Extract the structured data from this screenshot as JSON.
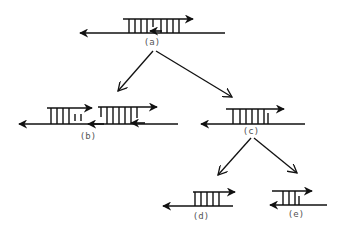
{
  "diagram": {
    "nodes": [
      {
        "id": "a",
        "label": "(a)"
      },
      {
        "id": "b",
        "label": "(b)"
      },
      {
        "id": "c",
        "label": "(c)"
      },
      {
        "id": "d",
        "label": "(d)"
      },
      {
        "id": "e",
        "label": "(e)"
      }
    ],
    "edges": [
      {
        "from": "a",
        "to": "b"
      },
      {
        "from": "a",
        "to": "c"
      },
      {
        "from": "c",
        "to": "d"
      },
      {
        "from": "c",
        "to": "e"
      }
    ],
    "colors": {
      "stroke": "#111111",
      "label": "#555555",
      "background": "#ffffff"
    }
  }
}
